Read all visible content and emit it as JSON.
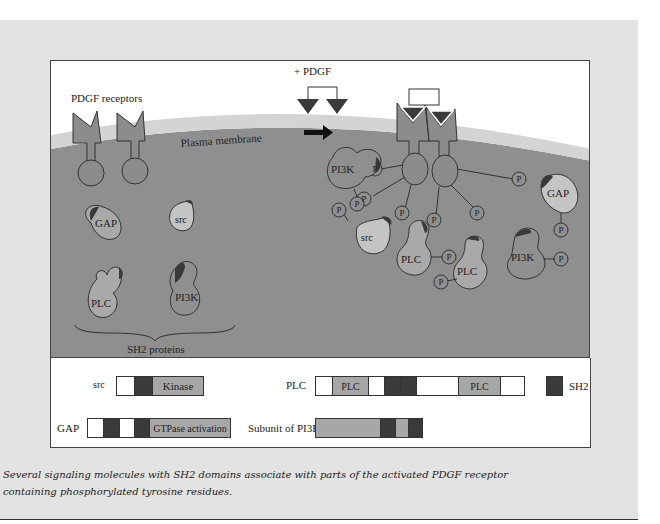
{
  "figure": {
    "labels": {
      "pdgf_receptors": "PDGF receptors",
      "plus_pdgf": "+ PDGF",
      "plasma_membrane": "Plasma membrane",
      "sh2_proteins": "SH2 proteins"
    },
    "free_proteins": [
      {
        "name": "GAP"
      },
      {
        "name": "src"
      },
      {
        "name": "PLC"
      },
      {
        "name": "PI3K"
      }
    ],
    "bound_proteins": [
      {
        "name": "PI3K"
      },
      {
        "name": "src"
      },
      {
        "name": "PLC"
      },
      {
        "name": "PLC"
      },
      {
        "name": "PI3K"
      },
      {
        "name": "GAP"
      }
    ],
    "phospho_label": "P",
    "colors": {
      "cytoplasm": "#8f8f8f",
      "membrane": "#d4d4d4",
      "receptor": "#8c8c8c",
      "sh2_domain": "#3a3a3a",
      "light_protein": "#c4c4c4",
      "ligand": "#3a3a3a"
    }
  },
  "legend": {
    "src": {
      "label": "src",
      "kinase": "Kinase"
    },
    "plc": {
      "label": "PLC",
      "seg1": "PLC",
      "seg2": "PLC"
    },
    "sh2_key": {
      "label": "SH2"
    },
    "gap": {
      "label": "GAP",
      "gtpase": "GTPase activation"
    },
    "pi3k": {
      "label": "Subunit of PI3K"
    }
  },
  "caption": {
    "line1": "Several signaling molecules with SH2 domains associate with parts of the activated PDGF receptor",
    "line2": "containing phosphorylated tyrosine residues."
  }
}
